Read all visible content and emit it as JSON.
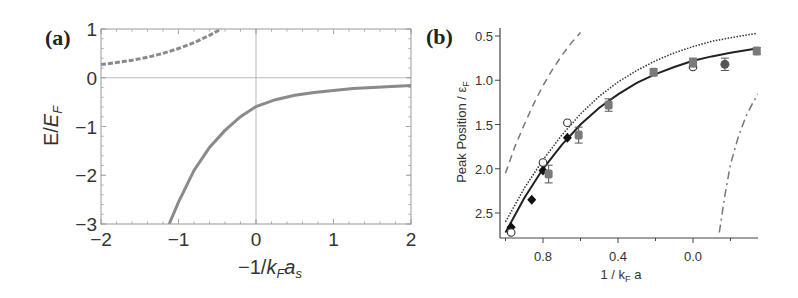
{
  "chart_data": [
    {
      "panel": "(a)",
      "type": "line",
      "xlabel": "-1/k_F a_s",
      "ylabel": "E/E_F",
      "xlim": [
        -2,
        2
      ],
      "ylim": [
        -3,
        1
      ],
      "x_ticks": [
        "-2",
        "-1",
        "0",
        "1",
        "2"
      ],
      "y_ticks": [
        "1",
        "0",
        "-1",
        "-2",
        "-3"
      ],
      "grid": false,
      "reference_lines": {
        "x": 0,
        "y": 0
      },
      "series": [
        {
          "name": "upper branch (dashed)",
          "style": "dashed",
          "color": "#8a8a8a",
          "x": [
            -2.0,
            -1.8,
            -1.6,
            -1.4,
            -1.2,
            -1.0,
            -0.8,
            -0.6,
            -0.45
          ],
          "y": [
            0.27,
            0.31,
            0.36,
            0.42,
            0.5,
            0.6,
            0.72,
            0.87,
            1.0
          ]
        },
        {
          "name": "bound state (solid)",
          "style": "solid",
          "color": "#8a8a8a",
          "x": [
            -1.12,
            -1.0,
            -0.8,
            -0.6,
            -0.4,
            -0.2,
            0.0,
            0.25,
            0.5,
            0.75,
            1.0,
            1.25,
            1.5,
            1.75,
            2.0
          ],
          "y": [
            -3.0,
            -2.55,
            -1.9,
            -1.43,
            -1.08,
            -0.8,
            -0.59,
            -0.45,
            -0.36,
            -0.3,
            -0.26,
            -0.22,
            -0.2,
            -0.18,
            -0.16
          ]
        }
      ]
    },
    {
      "panel": "(b)",
      "type": "scatter",
      "xlabel": "1 / k_F a",
      "ylabel": "Peak Position / ε_F",
      "xlim": [
        1.03,
        -0.35
      ],
      "ylim": [
        2.78,
        0.44
      ],
      "x_ticks": [
        "0.8",
        "0.4",
        "0.0"
      ],
      "y_ticks": [
        "0.5",
        "1.0",
        "1.5",
        "2.0",
        "2.5"
      ],
      "y_inverted": true,
      "x_reversed": true,
      "grid": false,
      "series": [
        {
          "name": "theory (solid)",
          "style": "solid",
          "x": [
            1.0,
            0.9,
            0.8,
            0.7,
            0.6,
            0.5,
            0.4,
            0.3,
            0.2,
            0.1,
            0.0,
            -0.1,
            -0.2,
            -0.34
          ],
          "y": [
            2.72,
            2.33,
            2.0,
            1.73,
            1.5,
            1.31,
            1.16,
            1.03,
            0.93,
            0.85,
            0.78,
            0.73,
            0.69,
            0.64
          ]
        },
        {
          "name": "theory (dotted)",
          "style": "dotted",
          "x": [
            1.0,
            0.9,
            0.8,
            0.7,
            0.6,
            0.5,
            0.4,
            0.3,
            0.2,
            0.1,
            0.0,
            -0.1,
            -0.2,
            -0.34
          ],
          "y": [
            2.6,
            2.22,
            1.9,
            1.62,
            1.38,
            1.18,
            1.02,
            0.89,
            0.78,
            0.69,
            0.62,
            0.56,
            0.52,
            0.47
          ]
        },
        {
          "name": "theory (dashed)",
          "style": "dashed",
          "x": [
            1.0,
            0.95,
            0.9,
            0.85,
            0.8,
            0.75,
            0.7,
            0.65,
            0.6
          ],
          "y": [
            2.05,
            1.75,
            1.5,
            1.27,
            1.06,
            0.88,
            0.72,
            0.58,
            0.46
          ]
        },
        {
          "name": "theory (dash-dot)",
          "style": "dashdot",
          "x": [
            -0.14,
            -0.17,
            -0.2,
            -0.24,
            -0.28,
            -0.32,
            -0.35
          ],
          "y": [
            2.72,
            2.3,
            1.95,
            1.65,
            1.42,
            1.25,
            1.15
          ]
        },
        {
          "name": "filled diamonds",
          "marker": "diamond-filled",
          "x": [
            0.97,
            0.86,
            0.8,
            0.67
          ],
          "y": [
            2.66,
            2.35,
            2.02,
            1.65
          ]
        },
        {
          "name": "open circles",
          "marker": "circle-open",
          "x": [
            0.97,
            0.8,
            0.67,
            0.0
          ],
          "y": [
            2.72,
            1.93,
            1.48,
            0.85
          ]
        },
        {
          "name": "gray squares",
          "marker": "square-gray",
          "x": [
            0.77,
            0.61,
            0.45,
            0.21,
            0.0,
            -0.34
          ],
          "y": [
            2.06,
            1.62,
            1.28,
            0.91,
            0.8,
            0.67
          ],
          "yerr": [
            0.1,
            0.09,
            0.07,
            0.04,
            0.05,
            0.04
          ]
        },
        {
          "name": "dark circle",
          "marker": "circle-filled",
          "x": [
            -0.17
          ],
          "y": [
            0.82
          ],
          "yerr": [
            0.07
          ]
        }
      ]
    }
  ],
  "labels": {
    "panel_a": "(a)",
    "panel_b": "(b)"
  }
}
